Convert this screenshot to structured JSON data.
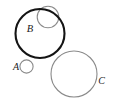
{
  "figure": {
    "background_color": "#ffffff",
    "width": 116,
    "height": 112,
    "shapes": [
      {
        "id": "circle-b",
        "label": "B",
        "cx": 40.0,
        "cy": 33.5,
        "r": 24.5,
        "stroke_color": "#141414",
        "stroke_width": 2.1,
        "fill": "none",
        "label_x": 30.0,
        "label_y": 29.5,
        "label_font_size": 10.5
      },
      {
        "id": "circle-inner",
        "label": "",
        "cx": 48.0,
        "cy": 17.0,
        "r": 10.8,
        "stroke_color": "#8a8a8a",
        "stroke_width": 1.1,
        "fill": "none",
        "label_x": 0,
        "label_y": 0,
        "label_font_size": 0
      },
      {
        "id": "circle-a",
        "label": "A",
        "cx": 26.5,
        "cy": 66.5,
        "r": 6.6,
        "stroke_color": "#8a8a8a",
        "stroke_width": 1.1,
        "fill": "none",
        "label_x": 16.0,
        "label_y": 68.0,
        "label_font_size": 10.0
      },
      {
        "id": "circle-c",
        "label": "C",
        "cx": 74.0,
        "cy": 74.0,
        "r": 23.0,
        "stroke_color": "#8a8a8a",
        "stroke_width": 1.1,
        "fill": "none",
        "label_x": 101.5,
        "label_y": 82.0,
        "label_font_size": 10.0
      }
    ]
  }
}
